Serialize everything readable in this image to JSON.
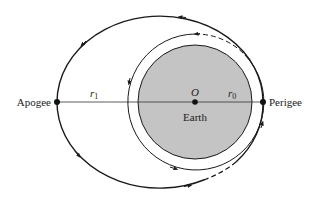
{
  "diagram": {
    "labels": {
      "apogee": "Apogee",
      "perigee": "Perigee",
      "earth": "Earth",
      "center": "O",
      "r1_main": "r",
      "r1_sub": "1",
      "r0_main": "r",
      "r0_sub": "0"
    },
    "colors": {
      "earth_fill": "#c4c4c4",
      "stroke": "#1a1a1a",
      "background": "#ffffff"
    },
    "elements": {
      "earth": {
        "cx": 195,
        "cy": 102,
        "r": 57
      },
      "circular_orbit": {
        "cx": 195,
        "cy": 102,
        "r": 68
      },
      "elliptical_orbit": {
        "cx": 160,
        "cy": 102,
        "rx": 103,
        "ry": 86
      },
      "apogee_point": {
        "x": 57,
        "y": 102
      },
      "perigee_point": {
        "x": 263,
        "y": 102
      },
      "center_point": {
        "x": 195,
        "y": 102
      }
    }
  }
}
